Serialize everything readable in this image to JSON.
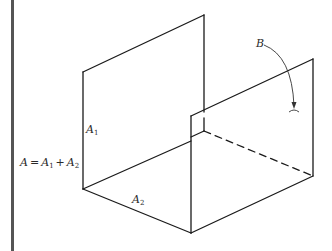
{
  "diagram": {
    "type": "isometric-angle-section",
    "stroke_color": "#1a1a1a",
    "margin_bar_color": "#555555",
    "labels": {
      "b": {
        "text": "B"
      },
      "a1": {
        "main": "A",
        "sub": "1"
      },
      "a2": {
        "main": "A",
        "sub": "2"
      },
      "equation": {
        "lhs": "A",
        "eq": "=",
        "t1_main": "A",
        "t1_sub": "1",
        "plus": "+",
        "t2_main": "A",
        "t2_sub": "2"
      }
    },
    "edges": [
      {
        "name": "back-panel-top-edge",
        "from": [
          83,
          72
        ],
        "to": [
          204,
          15
        ],
        "style": "solid"
      },
      {
        "name": "back-panel-left-edge",
        "from": [
          83,
          72
        ],
        "to": [
          83,
          189
        ],
        "style": "solid"
      },
      {
        "name": "back-panel-right-edge",
        "from": [
          204,
          15
        ],
        "to": [
          204,
          131
        ],
        "style": "solid"
      },
      {
        "name": "floor-front-edge",
        "from": [
          83,
          189
        ],
        "to": [
          191,
          233
        ],
        "style": "solid"
      },
      {
        "name": "floor-back-edge",
        "from": [
          83,
          189
        ],
        "to": [
          191,
          141
        ],
        "style": "solid"
      },
      {
        "name": "front-panel-top-edge",
        "from": [
          191,
          116
        ],
        "to": [
          313,
          59
        ],
        "style": "solid"
      },
      {
        "name": "front-panel-left-edge",
        "from": [
          191,
          116
        ],
        "to": [
          191,
          233
        ],
        "style": "solid"
      },
      {
        "name": "front-panel-right-edge",
        "from": [
          313,
          59
        ],
        "to": [
          313,
          176
        ],
        "style": "solid"
      },
      {
        "name": "front-panel-bottom-edge",
        "from": [
          191,
          233
        ],
        "to": [
          313,
          176
        ],
        "style": "solid"
      },
      {
        "name": "hidden-floor-edge",
        "from": [
          204,
          131
        ],
        "to": [
          313,
          176
        ],
        "style": "dashed"
      }
    ]
  }
}
